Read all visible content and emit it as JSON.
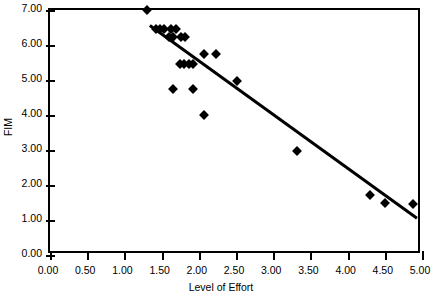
{
  "chart_data": {
    "type": "scatter",
    "title": "",
    "xlabel": "Level of Effort",
    "ylabel": "FIM",
    "xlim": [
      0.0,
      5.0
    ],
    "ylim": [
      0.0,
      7.0
    ],
    "xticks": [
      "0.00",
      "0.50",
      "1.00",
      "1.50",
      "2.00",
      "2.50",
      "3.00",
      "3.50",
      "4.00",
      "4.50",
      "5.00"
    ],
    "xtick_values": [
      0.0,
      0.5,
      1.0,
      1.5,
      2.0,
      2.5,
      3.0,
      3.5,
      4.0,
      4.5,
      5.0
    ],
    "yticks": [
      "0.00",
      "1.00",
      "2.00",
      "3.00",
      "4.00",
      "5.00",
      "6.00",
      "7.00"
    ],
    "ytick_values": [
      0.0,
      1.0,
      2.0,
      3.0,
      4.0,
      5.0,
      6.0,
      7.0
    ],
    "grid": false,
    "legend": false,
    "marker": "diamond",
    "marker_color": "#000000",
    "points": [
      {
        "x": 1.3,
        "y": 7.0
      },
      {
        "x": 1.42,
        "y": 6.47
      },
      {
        "x": 1.48,
        "y": 6.47
      },
      {
        "x": 1.53,
        "y": 6.47
      },
      {
        "x": 1.63,
        "y": 6.47
      },
      {
        "x": 1.7,
        "y": 6.47
      },
      {
        "x": 1.6,
        "y": 6.22
      },
      {
        "x": 1.65,
        "y": 6.22
      },
      {
        "x": 1.76,
        "y": 6.22
      },
      {
        "x": 1.82,
        "y": 6.22
      },
      {
        "x": 1.75,
        "y": 5.47
      },
      {
        "x": 1.8,
        "y": 5.47
      },
      {
        "x": 1.87,
        "y": 5.47
      },
      {
        "x": 1.92,
        "y": 5.47
      },
      {
        "x": 1.65,
        "y": 4.73
      },
      {
        "x": 1.92,
        "y": 4.73
      },
      {
        "x": 2.07,
        "y": 5.73
      },
      {
        "x": 2.23,
        "y": 5.73
      },
      {
        "x": 2.07,
        "y": 4.0
      },
      {
        "x": 2.51,
        "y": 4.98
      },
      {
        "x": 3.32,
        "y": 2.97
      },
      {
        "x": 4.3,
        "y": 1.72
      },
      {
        "x": 4.5,
        "y": 1.48
      },
      {
        "x": 4.88,
        "y": 1.47
      }
    ],
    "trendline": {
      "type": "line",
      "x": [
        1.35,
        5.0
      ],
      "y": [
        6.55,
        0.95
      ],
      "color": "#000000",
      "width": 3
    }
  }
}
